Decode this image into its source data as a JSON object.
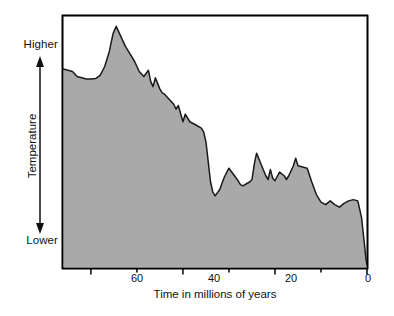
{
  "chart_data": {
    "type": "area",
    "title": "",
    "xlabel": "Time in millions of years",
    "ylabel": "Temperature",
    "y_top_label": "Higher",
    "y_bottom_label": "Lower",
    "x_major_ticks": [
      60,
      40,
      20,
      0
    ],
    "x_major_tick_labels": [
      "60",
      "40",
      "20",
      "0"
    ],
    "x_minor_ticks": [
      50,
      30,
      10
    ],
    "xlim": [
      66,
      0
    ],
    "x_axis_direction": "decreasing-left-to-right",
    "ylim": [
      0,
      100
    ],
    "y_axis_ticks_shown": false,
    "grid": false,
    "legend": false,
    "fill_color": "#a9a9a9",
    "line_color": "#1a1a1a",
    "frame_color": "#000000",
    "background_color": "#ffffff",
    "x": [
      66.0,
      65.0,
      64.0,
      63.0,
      62.0,
      61.0,
      60.0,
      59.0,
      58.0,
      57.0,
      56.0,
      55.2,
      54.5,
      53.5,
      52.5,
      51.5,
      50.5,
      49.5,
      48.5,
      47.5,
      47.0,
      46.5,
      46.0,
      45.0,
      44.5,
      44.0,
      43.0,
      42.0,
      41.5,
      41.0,
      40.0,
      39.5,
      39.0,
      38.5,
      38.0,
      37.5,
      37.0,
      36.0,
      35.5,
      35.0,
      34.5,
      34.0,
      33.5,
      33.0,
      32.0,
      31.0,
      30.0,
      29.0,
      28.0,
      27.5,
      27.0,
      26.0,
      25.5,
      25.0,
      24.5,
      24.0,
      23.0,
      22.0,
      21.5,
      21.0,
      20.5,
      20.0,
      19.0,
      18.0,
      17.5,
      17.0,
      16.0,
      15.5,
      15.0,
      14.0,
      13.0,
      12.0,
      11.0,
      10.0,
      9.0,
      8.0,
      7.0,
      6.0,
      5.0,
      4.0,
      3.0,
      2.0,
      1.2,
      0.6,
      0.2,
      0.0
    ],
    "y": [
      79.0,
      78.5,
      78.0,
      76.0,
      75.5,
      75.0,
      75.0,
      75.2,
      76.5,
      80.0,
      86.0,
      93.0,
      96.0,
      92.0,
      88.0,
      85.0,
      82.0,
      78.0,
      76.0,
      78.5,
      74.0,
      72.0,
      75.5,
      71.0,
      69.5,
      69.0,
      67.0,
      65.0,
      63.0,
      64.5,
      58.0,
      61.0,
      59.5,
      58.0,
      57.5,
      57.0,
      56.5,
      55.5,
      54.0,
      50.0,
      42.0,
      34.0,
      30.0,
      28.5,
      31.0,
      36.0,
      39.5,
      37.0,
      34.5,
      33.0,
      32.5,
      33.5,
      34.0,
      35.0,
      41.0,
      45.5,
      41.0,
      36.5,
      35.0,
      39.0,
      35.5,
      34.5,
      38.0,
      36.5,
      35.0,
      36.5,
      40.5,
      43.5,
      40.5,
      40.0,
      39.5,
      34.0,
      29.0,
      26.0,
      25.0,
      26.5,
      25.0,
      24.0,
      25.5,
      26.5,
      27.0,
      26.5,
      20.0,
      10.0,
      3.0,
      1.0
    ]
  }
}
